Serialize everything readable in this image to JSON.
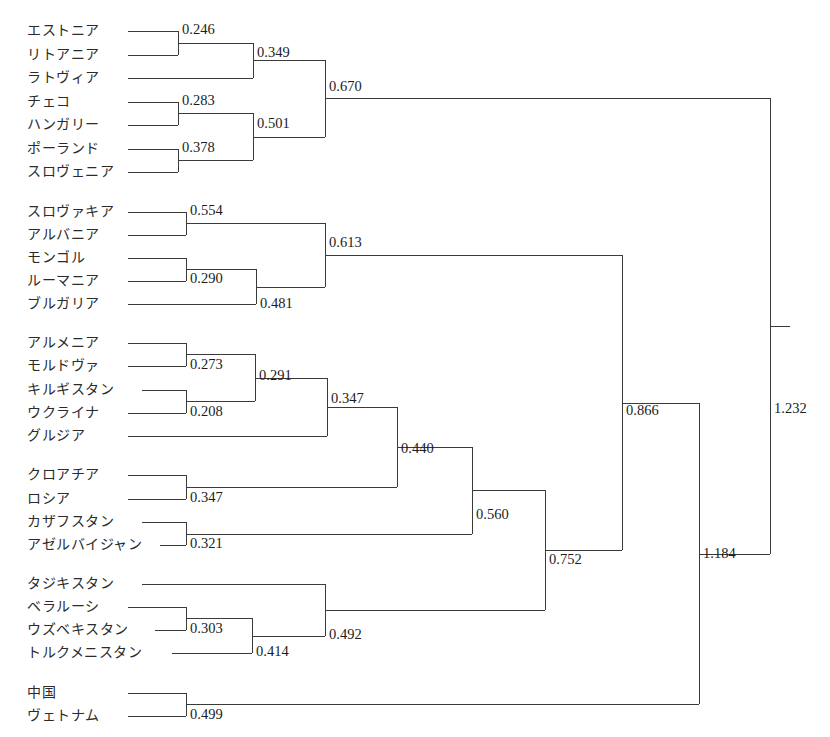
{
  "chart_data": {
    "type": "dendrogram",
    "title": "",
    "xlabel": "",
    "ylabel": "",
    "orientation": "horizontal-left-to-right",
    "line_color": "#3a3a3a",
    "background": "#ffffff",
    "leaves": [
      {
        "label": "エストニア",
        "y": 31
      },
      {
        "label": "リトアニア",
        "y": 55
      },
      {
        "label": "ラトヴィア",
        "y": 78
      },
      {
        "label": "チェコ",
        "y": 102
      },
      {
        "label": "ハンガリー",
        "y": 125
      },
      {
        "label": "ポーランド",
        "y": 149
      },
      {
        "label": "スロヴェニア",
        "y": 172
      },
      {
        "label": "スロヴァキア",
        "y": 212
      },
      {
        "label": "アルバニア",
        "y": 235
      },
      {
        "label": "モンゴル",
        "y": 258
      },
      {
        "label": "ルーマニア",
        "y": 281
      },
      {
        "label": "ブルガリア",
        "y": 304
      },
      {
        "label": "アルメニア",
        "y": 343
      },
      {
        "label": "モルドヴァ",
        "y": 366
      },
      {
        "label": "キルギスタン",
        "y": 390
      },
      {
        "label": "ウクライナ",
        "y": 413
      },
      {
        "label": "グルジア",
        "y": 436
      },
      {
        "label": "クロアチア",
        "y": 475
      },
      {
        "label": "ロシア",
        "y": 499
      },
      {
        "label": "カザフスタン",
        "y": 522
      },
      {
        "label": "アゼルバイジャン",
        "y": 545
      },
      {
        "label": "タジキスタン",
        "y": 584
      },
      {
        "label": "ベラルーシ",
        "y": 607
      },
      {
        "label": "ウズベキスタン",
        "y": 630
      },
      {
        "label": "トルクメニスタン",
        "y": 653
      },
      {
        "label": "中国",
        "y": 693
      },
      {
        "label": "ヴェトナム",
        "y": 716
      }
    ],
    "merges": [
      {
        "id": "m0246",
        "value": "0.246",
        "x": 178,
        "y_top": 31,
        "y_bot": 55,
        "label_pos": "above",
        "label_x": 182,
        "label_y": 36
      },
      {
        "id": "m0349",
        "value": "0.349",
        "x": 253,
        "y_top": 43,
        "y_bot": 78,
        "label_pos": "above",
        "label_x": 257,
        "label_y": 59
      },
      {
        "id": "m0283",
        "value": "0.283",
        "x": 178,
        "y_top": 102,
        "y_bot": 125,
        "label_pos": "above",
        "label_x": 182,
        "label_y": 107
      },
      {
        "id": "m0378",
        "value": "0.378",
        "x": 178,
        "y_top": 149,
        "y_bot": 172,
        "label_pos": "above",
        "label_x": 182,
        "label_y": 154
      },
      {
        "id": "m0501",
        "value": "0.501",
        "x": 253,
        "y_top": 113,
        "y_bot": 160,
        "label_pos": "above",
        "label_x": 257,
        "label_y": 130
      },
      {
        "id": "m0670",
        "value": "0.670",
        "x": 325,
        "y_top": 60,
        "y_bot": 137,
        "label_pos": "above",
        "label_x": 329,
        "label_y": 93
      },
      {
        "id": "m0554",
        "value": "0.554",
        "x": 186,
        "y_top": 212,
        "y_bot": 235,
        "label_pos": "above",
        "label_x": 190,
        "label_y": 217
      },
      {
        "id": "m0290",
        "value": "0.290",
        "x": 186,
        "y_top": 258,
        "y_bot": 281,
        "label_pos": "above",
        "label_x": 190,
        "label_y": 285
      },
      {
        "id": "m0481",
        "value": "0.481",
        "x": 256,
        "y_top": 269,
        "y_bot": 304,
        "label_pos": "above",
        "label_x": 260,
        "label_y": 310
      },
      {
        "id": "m0613",
        "value": "0.613",
        "x": 325,
        "y_top": 223,
        "y_bot": 287,
        "label_pos": "above",
        "label_x": 329,
        "label_y": 249
      },
      {
        "id": "m0273",
        "value": "0.273",
        "x": 186,
        "y_top": 343,
        "y_bot": 366,
        "label_pos": "above",
        "label_x": 190,
        "label_y": 371
      },
      {
        "id": "m0208",
        "value": "0.208",
        "x": 186,
        "y_top": 390,
        "y_bot": 413,
        "label_pos": "above",
        "label_x": 190,
        "label_y": 418
      },
      {
        "id": "m0291",
        "value": "0.291",
        "x": 255,
        "y_top": 354,
        "y_bot": 401,
        "label_pos": "above",
        "label_x": 259,
        "label_y": 382
      },
      {
        "id": "m0347a",
        "value": "0.347",
        "x": 327,
        "y_top": 378,
        "y_bot": 436,
        "label_pos": "above",
        "label_x": 331,
        "label_y": 405
      },
      {
        "id": "m0347b",
        "value": "0.347",
        "x": 186,
        "y_top": 475,
        "y_bot": 499,
        "label_pos": "above",
        "label_x": 190,
        "label_y": 504
      },
      {
        "id": "m0321",
        "value": "0.321",
        "x": 186,
        "y_top": 522,
        "y_bot": 545,
        "label_pos": "above",
        "label_x": 190,
        "label_y": 550
      },
      {
        "id": "m0440",
        "value": "0.440",
        "x": 397,
        "y_top": 407,
        "y_bot": 487,
        "label_pos": "above",
        "label_x": 401,
        "label_y": 455
      },
      {
        "id": "m0560",
        "value": "0.560",
        "x": 472,
        "y_top": 447,
        "y_bot": 534,
        "label_pos": "above",
        "label_x": 476,
        "label_y": 521
      },
      {
        "id": "m0303",
        "value": "0.303",
        "x": 186,
        "y_top": 607,
        "y_bot": 630,
        "label_pos": "above",
        "label_x": 190,
        "label_y": 635
      },
      {
        "id": "m0414",
        "value": "0.414",
        "x": 252,
        "y_top": 618,
        "y_bot": 653,
        "label_pos": "above",
        "label_x": 256,
        "label_y": 658
      },
      {
        "id": "m0492",
        "value": "0.492",
        "x": 325,
        "y_top": 584,
        "y_bot": 636,
        "label_pos": "above",
        "label_x": 329,
        "label_y": 641
      },
      {
        "id": "m0752",
        "value": "0.752",
        "x": 545,
        "y_top": 490,
        "y_bot": 610,
        "label_pos": "above",
        "label_x": 549,
        "label_y": 566
      },
      {
        "id": "m0866",
        "value": "0.866",
        "x": 622,
        "y_top": 255,
        "y_bot": 550,
        "label_pos": "above",
        "label_x": 626,
        "label_y": 417
      },
      {
        "id": "m0499",
        "value": "0.499",
        "x": 186,
        "y_top": 693,
        "y_bot": 716,
        "label_pos": "above",
        "label_x": 190,
        "label_y": 721
      },
      {
        "id": "m1184",
        "value": "1.184",
        "x": 699,
        "y_top": 403,
        "y_bot": 704,
        "label_pos": "above",
        "label_x": 703,
        "label_y": 560
      },
      {
        "id": "m1232",
        "value": "1.232",
        "x": 770,
        "y_top": 98,
        "y_bot": 554,
        "label_pos": "above",
        "label_x": 774,
        "label_y": 415
      }
    ],
    "links": [
      {
        "from": "leaf",
        "label": "エストニア",
        "x1": 128,
        "y1": 31,
        "x2": 178
      },
      {
        "from": "leaf",
        "label": "リトアニア",
        "x1": 128,
        "y1": 55,
        "x2": 178
      },
      {
        "from": "leaf",
        "label": "ラトヴィア",
        "x1": 128,
        "y1": 78,
        "x2": 253
      },
      {
        "from": "leaf",
        "label": "チェコ",
        "x1": 128,
        "y1": 102,
        "x2": 178
      },
      {
        "from": "leaf",
        "label": "ハンガリー",
        "x1": 128,
        "y1": 125,
        "x2": 178
      },
      {
        "from": "leaf",
        "label": "ポーランド",
        "x1": 128,
        "y1": 149,
        "x2": 178
      },
      {
        "from": "leaf",
        "label": "スロヴェニア",
        "x1": 128,
        "y1": 172,
        "x2": 178
      },
      {
        "from": "leaf",
        "label": "スロヴァキア",
        "x1": 128,
        "y1": 212,
        "x2": 186
      },
      {
        "from": "leaf",
        "label": "アルバニア",
        "x1": 128,
        "y1": 235,
        "x2": 186
      },
      {
        "from": "leaf",
        "label": "モンゴル",
        "x1": 128,
        "y1": 258,
        "x2": 186
      },
      {
        "from": "leaf",
        "label": "ルーマニア",
        "x1": 128,
        "y1": 281,
        "x2": 186
      },
      {
        "from": "leaf",
        "label": "ブルガリア",
        "x1": 128,
        "y1": 304,
        "x2": 256
      },
      {
        "from": "leaf",
        "label": "アルメニア",
        "x1": 128,
        "y1": 343,
        "x2": 186
      },
      {
        "from": "leaf",
        "label": "モルドヴァ",
        "x1": 128,
        "y1": 366,
        "x2": 186
      },
      {
        "from": "leaf",
        "label": "キルギスタン",
        "x1": 142,
        "y1": 390,
        "x2": 186
      },
      {
        "from": "leaf",
        "label": "ウクライナ",
        "x1": 128,
        "y1": 413,
        "x2": 186
      },
      {
        "from": "leaf",
        "label": "グルジア",
        "x1": 128,
        "y1": 436,
        "x2": 327
      },
      {
        "from": "leaf",
        "label": "クロアチア",
        "x1": 128,
        "y1": 475,
        "x2": 186
      },
      {
        "from": "leaf",
        "label": "ロシア",
        "x1": 128,
        "y1": 499,
        "x2": 186
      },
      {
        "from": "leaf",
        "label": "カザフスタン",
        "x1": 142,
        "y1": 522,
        "x2": 186
      },
      {
        "from": "leaf",
        "label": "アゼルバイジャン",
        "x1": 160,
        "y1": 545,
        "x2": 186
      },
      {
        "from": "leaf",
        "label": "タジキスタン",
        "x1": 142,
        "y1": 584,
        "x2": 325
      },
      {
        "from": "leaf",
        "label": "ベラルーシ",
        "x1": 128,
        "y1": 607,
        "x2": 186
      },
      {
        "from": "leaf",
        "label": "ウズベキスタン",
        "x1": 155,
        "y1": 630,
        "x2": 186
      },
      {
        "from": "leaf",
        "label": "トルクメニスタン",
        "x1": 172,
        "y1": 653,
        "x2": 252
      },
      {
        "from": "leaf",
        "label": "中国",
        "x1": 128,
        "y1": 693,
        "x2": 186
      },
      {
        "from": "leaf",
        "label": "ヴェトナム",
        "x1": 128,
        "y1": 716,
        "x2": 186
      },
      {
        "from": "m0246",
        "x1": 178,
        "y1": 43,
        "x2": 253
      },
      {
        "from": "m0283",
        "x1": 178,
        "y1": 113,
        "x2": 253
      },
      {
        "from": "m0378",
        "x1": 178,
        "y1": 160,
        "x2": 253
      },
      {
        "from": "m0349",
        "x1": 253,
        "y1": 60,
        "x2": 325
      },
      {
        "from": "m0501",
        "x1": 253,
        "y1": 137,
        "x2": 325
      },
      {
        "from": "m0670",
        "x1": 325,
        "y1": 98,
        "x2": 770
      },
      {
        "from": "m0554",
        "x1": 186,
        "y1": 223,
        "x2": 325
      },
      {
        "from": "m0290",
        "x1": 186,
        "y1": 269,
        "x2": 256
      },
      {
        "from": "m0481",
        "x1": 256,
        "y1": 287,
        "x2": 325
      },
      {
        "from": "m0613",
        "x1": 325,
        "y1": 255,
        "x2": 622
      },
      {
        "from": "m0273",
        "x1": 186,
        "y1": 354,
        "x2": 255
      },
      {
        "from": "m0208",
        "x1": 186,
        "y1": 401,
        "x2": 255
      },
      {
        "from": "m0291",
        "x1": 255,
        "y1": 378,
        "x2": 327
      },
      {
        "from": "m0347a",
        "x1": 327,
        "y1": 407,
        "x2": 397
      },
      {
        "from": "m0347b",
        "x1": 186,
        "y1": 487,
        "x2": 397
      },
      {
        "from": "m0321",
        "x1": 186,
        "y1": 534,
        "x2": 472
      },
      {
        "from": "m0440",
        "x1": 397,
        "y1": 447,
        "x2": 472
      },
      {
        "from": "m0560",
        "x1": 472,
        "y1": 490,
        "x2": 545
      },
      {
        "from": "m0303",
        "x1": 186,
        "y1": 618,
        "x2": 252
      },
      {
        "from": "m0414",
        "x1": 252,
        "y1": 636,
        "x2": 325
      },
      {
        "from": "m0492",
        "x1": 325,
        "y1": 610,
        "x2": 545
      },
      {
        "from": "m0752",
        "x1": 545,
        "y1": 550,
        "x2": 622
      },
      {
        "from": "m0866",
        "x1": 622,
        "y1": 403,
        "x2": 699
      },
      {
        "from": "m0499",
        "x1": 186,
        "y1": 704,
        "x2": 699
      },
      {
        "from": "m1184",
        "x1": 699,
        "y1": 554,
        "x2": 770
      },
      {
        "from": "m1232",
        "x1": 770,
        "y1": 326,
        "x2": 790
      }
    ],
    "values": [
      "0.246",
      "0.349",
      "0.283",
      "0.378",
      "0.501",
      "0.670",
      "0.554",
      "0.290",
      "0.481",
      "0.613",
      "0.273",
      "0.208",
      "0.291",
      "0.347",
      "0.347",
      "0.321",
      "0.440",
      "0.560",
      "0.303",
      "0.414",
      "0.492",
      "0.752",
      "0.866",
      "0.499",
      "1.184",
      "1.232"
    ]
  }
}
